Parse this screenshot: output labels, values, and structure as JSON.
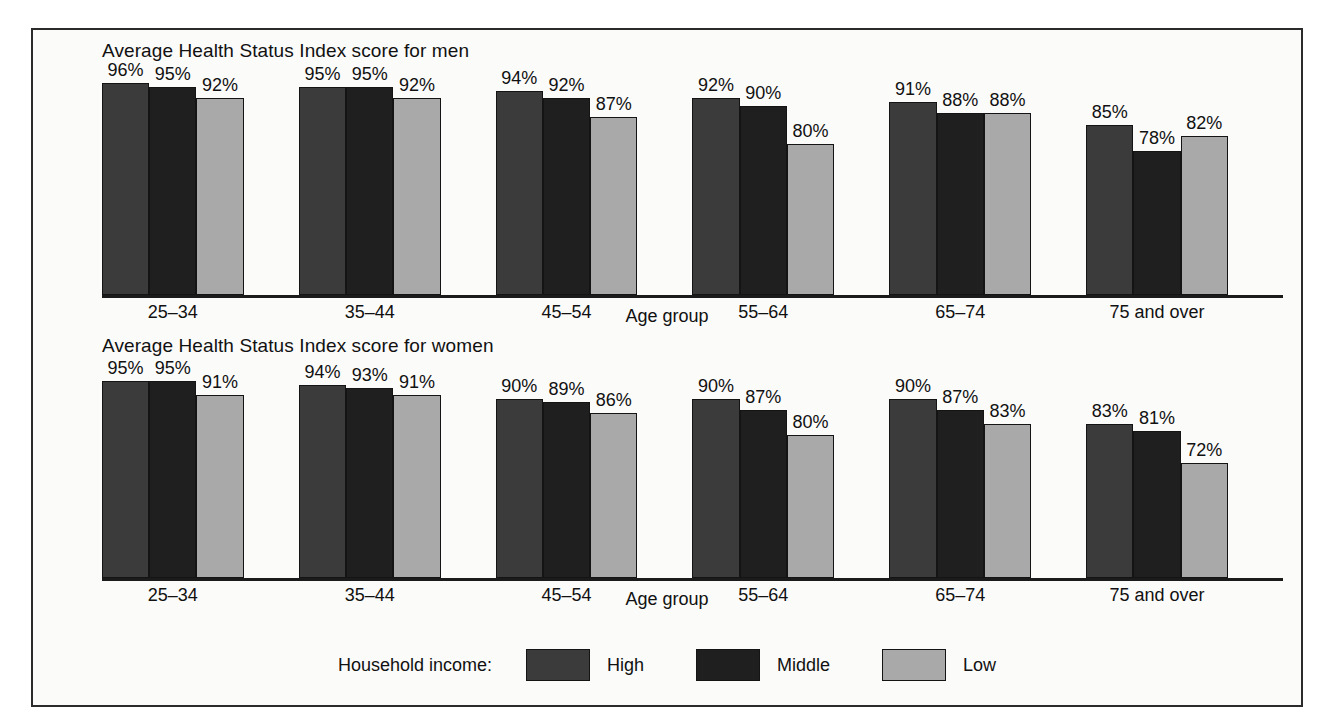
{
  "figure": {
    "axis_title": "Age group",
    "categories": [
      "25–34",
      "35–44",
      "45–54",
      "55–64",
      "65–74",
      "75 and over"
    ],
    "panels": [
      {
        "id": "men",
        "title": "Average Health Status Index score for men",
        "values": {
          "High": [
            96,
            95,
            94,
            92,
            91,
            85
          ],
          "Middle": [
            95,
            95,
            92,
            90,
            88,
            78
          ],
          "Low": [
            92,
            92,
            87,
            80,
            88,
            82
          ]
        },
        "labels": {
          "High": [
            "96%",
            "95%",
            "94%",
            "92%",
            "91%",
            "85%"
          ],
          "Middle": [
            "95%",
            "95%",
            "92%",
            "90%",
            "88%",
            "78%"
          ],
          "Low": [
            "92%",
            "92%",
            "87%",
            "80%",
            "88%",
            "82%"
          ]
        }
      },
      {
        "id": "women",
        "title": "Average Health Status Index score for women",
        "values": {
          "High": [
            95,
            94,
            90,
            90,
            90,
            83
          ],
          "Middle": [
            95,
            93,
            89,
            87,
            87,
            81
          ],
          "Low": [
            91,
            91,
            86,
            80,
            83,
            72
          ]
        },
        "labels": {
          "High": [
            "95%",
            "94%",
            "90%",
            "90%",
            "90%",
            "83%"
          ],
          "Middle": [
            "95%",
            "93%",
            "89%",
            "87%",
            "87%",
            "81%"
          ],
          "Low": [
            "91%",
            "91%",
            "86%",
            "80%",
            "83%",
            "72%"
          ]
        }
      }
    ]
  },
  "legend": {
    "title": "Household income:",
    "items": [
      {
        "label": "High",
        "key": "High",
        "color": "#3b3b3b"
      },
      {
        "label": "Middle",
        "key": "Middle",
        "color": "#1f1f1f"
      },
      {
        "label": "Low",
        "key": "Low",
        "color": "#a9a9a9"
      }
    ]
  },
  "chart_data": {
    "type": "bar",
    "xlabel": "Age group",
    "ylabel": "Average Health Status Index score (%)",
    "ylim": [
      40,
      100
    ],
    "grid": false,
    "legend_position": "bottom",
    "categories": [
      "25–34",
      "35–44",
      "45–54",
      "55–64",
      "65–74",
      "75 and over"
    ],
    "panels": [
      {
        "name": "Average Health Status Index score for men",
        "series": [
          {
            "name": "High",
            "values": [
              96,
              95,
              94,
              92,
              91,
              85
            ]
          },
          {
            "name": "Middle",
            "values": [
              95,
              95,
              92,
              90,
              88,
              78
            ]
          },
          {
            "name": "Low",
            "values": [
              92,
              92,
              87,
              80,
              88,
              82
            ]
          }
        ]
      },
      {
        "name": "Average Health Status Index score for women",
        "series": [
          {
            "name": "High",
            "values": [
              95,
              94,
              90,
              90,
              90,
              83
            ]
          },
          {
            "name": "Middle",
            "values": [
              95,
              93,
              89,
              87,
              87,
              81
            ]
          },
          {
            "name": "Low",
            "values": [
              91,
              91,
              86,
              80,
              83,
              72
            ]
          }
        ]
      }
    ]
  }
}
